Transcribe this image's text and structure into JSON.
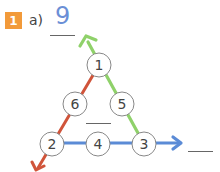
{
  "exercise": {
    "number": "1",
    "part_label": "a)",
    "answer": "9",
    "badge_color": "#f29a3a",
    "answer_color": "#6b8fd6"
  },
  "triangle": {
    "nodes": [
      {
        "id": "top",
        "value": "1"
      },
      {
        "id": "mid-left",
        "value": "6"
      },
      {
        "id": "mid-right",
        "value": "5"
      },
      {
        "id": "bottom-left",
        "value": "2"
      },
      {
        "id": "bottom-mid",
        "value": "4"
      },
      {
        "id": "bottom-right",
        "value": "3"
      }
    ],
    "arrows": {
      "left_side_color": "#d0543a",
      "right_side_color": "#8fd16a",
      "bottom_side_color": "#5b8bd6"
    }
  }
}
